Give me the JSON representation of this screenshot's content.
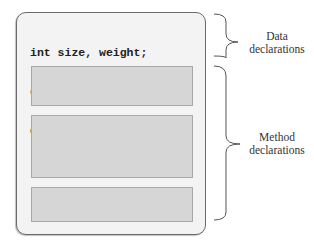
{
  "diagram": {
    "code_lines": [
      "int size, weight;",
      "char category;",
      "double value, cost;"
    ],
    "method_boxes": 3,
    "labels": {
      "data": [
        "Data",
        "declarations"
      ],
      "method": [
        "Method",
        "declarations"
      ]
    }
  }
}
